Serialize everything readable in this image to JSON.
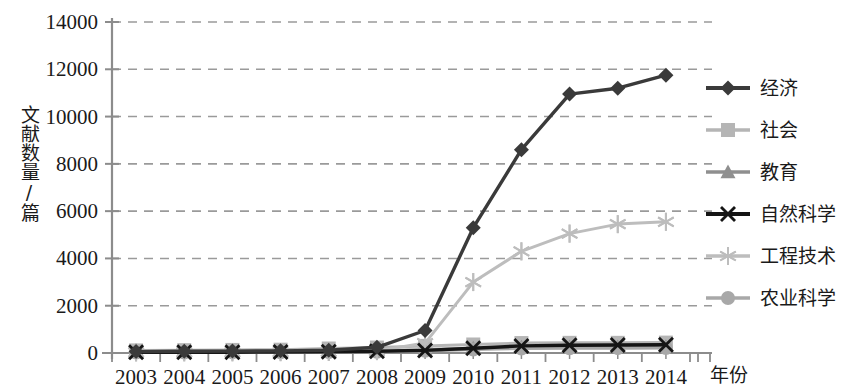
{
  "chart_data": {
    "type": "line",
    "title": "",
    "xlabel": "年份",
    "ylabel": "文献数量/篇",
    "categories": [
      "2003",
      "2004",
      "2005",
      "2006",
      "2007",
      "2008",
      "2009",
      "2010",
      "2011",
      "2012",
      "2013",
      "2014"
    ],
    "ylim": [
      0,
      14000
    ],
    "ytick_values": [
      0,
      2000,
      4000,
      6000,
      8000,
      10000,
      12000,
      14000
    ],
    "ytick_labels": [
      "0",
      "2000",
      "4000",
      "6000",
      "8000",
      "10000",
      "12000",
      "14000"
    ],
    "grid": true,
    "grid_style": "dashed-horizontal",
    "legend_position": "right",
    "series": [
      {
        "name": "经济",
        "marker": "diamond",
        "color": "#3a3a3a",
        "values": [
          60,
          70,
          80,
          90,
          120,
          240,
          950,
          5300,
          8600,
          10950,
          11200,
          11750
        ]
      },
      {
        "name": "社会",
        "marker": "square",
        "color": "#b5b5b5",
        "values": [
          110,
          120,
          130,
          140,
          190,
          230,
          300,
          360,
          420,
          430,
          430,
          440
        ]
      },
      {
        "name": "教育",
        "marker": "triangle",
        "color": "#8f8f8f",
        "values": [
          40,
          45,
          50,
          55,
          70,
          90,
          150,
          200,
          240,
          250,
          255,
          260
        ]
      },
      {
        "name": "自然科学",
        "marker": "x",
        "color": "#151515",
        "values": [
          30,
          32,
          35,
          40,
          50,
          70,
          110,
          200,
          300,
          330,
          340,
          350
        ]
      },
      {
        "name": "工程技术",
        "marker": "asterisk",
        "color": "#bdbdbd",
        "values": [
          25,
          28,
          30,
          35,
          45,
          80,
          420,
          3000,
          4300,
          5050,
          5450,
          5550
        ]
      },
      {
        "name": "农业科学",
        "marker": "circle",
        "color": "#a8a8a8",
        "values": [
          20,
          22,
          25,
          28,
          35,
          50,
          90,
          150,
          190,
          200,
          205,
          210
        ]
      }
    ]
  },
  "axis": {
    "y_title": "文献数量/篇",
    "x_title": "年份"
  },
  "colors": {
    "axis": "#8c8c8c",
    "grid": "#9a9a9a",
    "text": "#1a1a1a",
    "background": "#ffffff"
  }
}
